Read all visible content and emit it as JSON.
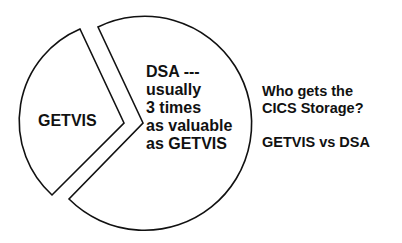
{
  "diagram": {
    "type": "exploded-pie",
    "slices": [
      {
        "name": "GETVIS",
        "label": "GETVIS"
      },
      {
        "name": "DSA",
        "label_lines": [
          "DSA ---",
          "usually",
          "3 times",
          "as valuable",
          "as GETVIS"
        ]
      }
    ],
    "caption": {
      "question_lines": [
        "Who gets the",
        "CICS Storage?"
      ],
      "subtitle": "GETVIS vs DSA"
    },
    "colors": {
      "stroke": "#111111",
      "fill": "#ffffff"
    }
  }
}
